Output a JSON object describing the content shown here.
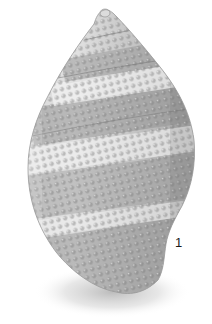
{
  "figure": {
    "label": "1",
    "colors": {
      "background": "#ffffff",
      "shell_light": "#e6e6e6",
      "shell_mid": "#b8b8b8",
      "shell_dark": "#8a8a8a",
      "shadow": "#c8c8c8",
      "label": "#1a1a1a"
    }
  }
}
